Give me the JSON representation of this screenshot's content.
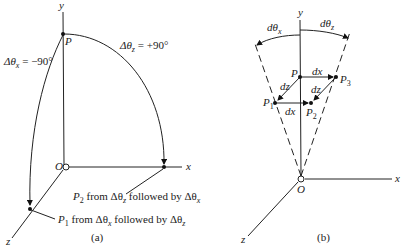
{
  "figure_a": {
    "axes": {
      "y": "y",
      "x": "x",
      "z": "z",
      "origin": "O"
    },
    "point_P": "P",
    "rotation_x_label": "Δθ",
    "rotation_x_sub": "x",
    "rotation_x_value": " = −90°",
    "rotation_z_label": "Δθ",
    "rotation_z_sub": "z",
    "rotation_z_value": " = +90°",
    "p2_note": "P",
    "p2_sub": "2",
    "p2_text": " from Δθ",
    "p2_text_sub1": "z",
    "p2_text2": " followed by Δθ",
    "p2_text_sub2": "x",
    "p1_note": "P",
    "p1_sub": "1",
    "p1_text": " from Δθ",
    "p1_text_sub1": "x",
    "p1_text2": " followed by Δθ",
    "p1_text_sub2": "z",
    "caption": "(a)"
  },
  "figure_b": {
    "axes": {
      "y": "y",
      "x": "x",
      "z": "z",
      "origin": "O"
    },
    "d_theta_x": "dθ",
    "d_theta_x_sub": "x",
    "d_theta_z": "dθ",
    "d_theta_z_sub": "z",
    "points": {
      "P": "P",
      "P1": "P",
      "P1_sub": "1",
      "P2": "P",
      "P2_sub": "2",
      "P3": "P",
      "P3_sub": "3"
    },
    "edges": {
      "dx_top": "dx",
      "dx_bottom": "dx",
      "dz_left": "dz",
      "dz_right": "dz"
    },
    "caption": "(b)"
  }
}
